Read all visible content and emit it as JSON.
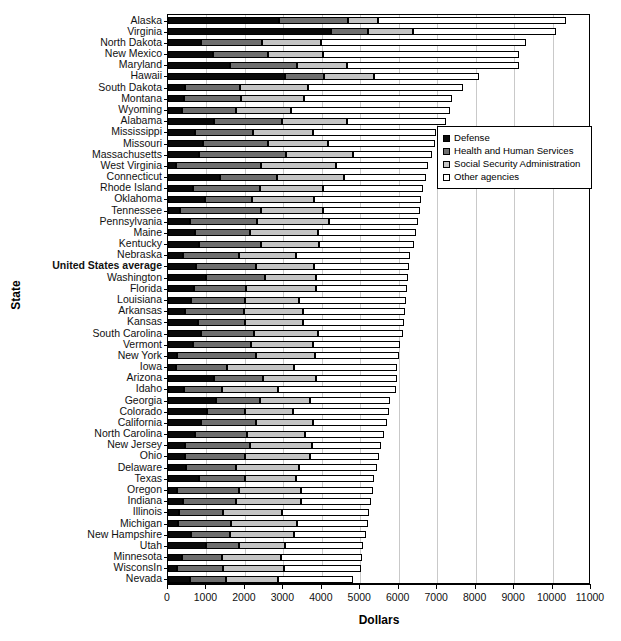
{
  "chart_data": {
    "type": "bar",
    "orientation": "horizontal",
    "stacked": true,
    "title": "",
    "xlabel": "Dollars",
    "ylabel": "State",
    "xlim": [
      0,
      11000
    ],
    "xticks": [
      0,
      1000,
      2000,
      3000,
      4000,
      5000,
      6000,
      7000,
      8000,
      9000,
      10000,
      11000
    ],
    "grid": "vertical",
    "legend_position": "upper-right-inside",
    "series": [
      {
        "name": "Defense",
        "color": "#0a0a0a"
      },
      {
        "name": "Health and Human Services",
        "color": "#6e6e6e"
      },
      {
        "name": "Social Security Administration",
        "color": "#c4c4c4"
      },
      {
        "name": "Other agencies",
        "color": "#ffffff"
      }
    ],
    "categories": [
      "Alaska",
      "Virginia",
      "North Dakota",
      "New Mexico",
      "Maryland",
      "Hawaii",
      "South Dakota",
      "Montana",
      "Wyoming",
      "Alabama",
      "Mississippi",
      "Missouri",
      "Massachusetts",
      "West Virginia",
      "Connecticut",
      "Rhode Island",
      "Oklahoma",
      "Tennessee",
      "Pennsylvania",
      "Maine",
      "Kentucky",
      "Nebraska",
      "United States average",
      "Washington",
      "Florida",
      "Louisiana",
      "Arkansas",
      "Kansas",
      "South Carolina",
      "Vermont",
      "New York",
      "Iowa",
      "Arizona",
      "Idaho",
      "Georgia",
      "Colorado",
      "California",
      "North Carolina",
      "New Jersey",
      "Ohio",
      "Delaware",
      "Texas",
      "Oregon",
      "Indiana",
      "Illinois",
      "Michigan",
      "New Hampshire",
      "Utah",
      "Minnesota",
      "WisconsIn",
      "Nevada"
    ],
    "highlight_category": "United States average",
    "rows": [
      {
        "state": "Alaska",
        "defense": 2890,
        "hhs": 1790,
        "ssa": 770,
        "other": 4890,
        "total": 10340
      },
      {
        "state": "Virginia",
        "defense": 4250,
        "hhs": 960,
        "ssa": 1150,
        "other": 3740,
        "total": 10100
      },
      {
        "state": "North Dakota",
        "defense": 850,
        "hhs": 1600,
        "ssa": 1530,
        "other": 5340,
        "total": 9320
      },
      {
        "state": "New Mexico",
        "defense": 1180,
        "hhs": 1430,
        "ssa": 1420,
        "other": 5110,
        "total": 9140
      },
      {
        "state": "Maryland",
        "defense": 1610,
        "hhs": 1740,
        "ssa": 1300,
        "other": 4470,
        "total": 9120
      },
      {
        "state": "Hawaii",
        "defense": 3040,
        "hhs": 1020,
        "ssa": 1300,
        "other": 2720,
        "total": 8080
      },
      {
        "state": "South Dakota",
        "defense": 440,
        "hhs": 1430,
        "ssa": 1780,
        "other": 4020,
        "total": 7670
      },
      {
        "state": "Montana",
        "defense": 420,
        "hhs": 1490,
        "ssa": 1630,
        "other": 3840,
        "total": 7380
      },
      {
        "state": "Wyoming",
        "defense": 370,
        "hhs": 1400,
        "ssa": 1440,
        "other": 4130,
        "total": 7340
      },
      {
        "state": "Alabama",
        "defense": 1200,
        "hhs": 1760,
        "ssa": 1700,
        "other": 2560,
        "total": 7220
      },
      {
        "state": "Mississippi",
        "defense": 690,
        "hhs": 1510,
        "ssa": 1580,
        "other": 3180,
        "total": 6960
      },
      {
        "state": "Missouri",
        "defense": 910,
        "hhs": 1680,
        "ssa": 1570,
        "other": 2780,
        "total": 6940
      },
      {
        "state": "Massachusetts",
        "defense": 810,
        "hhs": 2260,
        "ssa": 1730,
        "other": 2070,
        "total": 6870
      },
      {
        "state": "West Virginia",
        "defense": 210,
        "hhs": 2200,
        "ssa": 1970,
        "other": 2380,
        "total": 6760
      },
      {
        "state": "Connecticut",
        "defense": 1360,
        "hhs": 1470,
        "ssa": 1760,
        "other": 2110,
        "total": 6700
      },
      {
        "state": "Rhode Island",
        "defense": 640,
        "hhs": 1760,
        "ssa": 1630,
        "other": 2590,
        "total": 6620
      },
      {
        "state": "Oklahoma",
        "defense": 960,
        "hhs": 1220,
        "ssa": 1620,
        "other": 2790,
        "total": 6590
      },
      {
        "state": "Tennessee",
        "defense": 320,
        "hhs": 2090,
        "ssa": 1630,
        "other": 2520,
        "total": 6560
      },
      {
        "state": "Pennsylvania",
        "defense": 570,
        "hhs": 1750,
        "ssa": 1870,
        "other": 2320,
        "total": 6510
      },
      {
        "state": "Maine",
        "defense": 700,
        "hhs": 1420,
        "ssa": 1790,
        "other": 2540,
        "total": 6450
      },
      {
        "state": "Kentucky",
        "defense": 810,
        "hhs": 1620,
        "ssa": 1500,
        "other": 2470,
        "total": 6400
      },
      {
        "state": "Nebraska",
        "defense": 400,
        "hhs": 1440,
        "ssa": 1490,
        "other": 2970,
        "total": 6300
      },
      {
        "state": "United States average",
        "defense": 740,
        "hhs": 1560,
        "ssa": 1500,
        "other": 2460,
        "total": 6260
      },
      {
        "state": "Washington",
        "defense": 980,
        "hhs": 1540,
        "ssa": 1340,
        "other": 2370,
        "total": 6230
      },
      {
        "state": "Florida",
        "defense": 670,
        "hhs": 1350,
        "ssa": 1820,
        "other": 2380,
        "total": 6220
      },
      {
        "state": "Louisiana",
        "defense": 590,
        "hhs": 1410,
        "ssa": 1410,
        "other": 2790,
        "total": 6200
      },
      {
        "state": "Arkansas",
        "defense": 440,
        "hhs": 1540,
        "ssa": 1540,
        "other": 2650,
        "total": 6170
      },
      {
        "state": "Kansas",
        "defense": 780,
        "hhs": 1230,
        "ssa": 1510,
        "other": 2620,
        "total": 6140
      },
      {
        "state": "South Carolina",
        "defense": 870,
        "hhs": 1360,
        "ssa": 1680,
        "other": 2190,
        "total": 6100
      },
      {
        "state": "Vermont",
        "defense": 660,
        "hhs": 1500,
        "ssa": 1610,
        "other": 2270,
        "total": 6040
      },
      {
        "state": "New York",
        "defense": 230,
        "hhs": 2060,
        "ssa": 1530,
        "other": 2190,
        "total": 6010
      },
      {
        "state": "Iowa",
        "defense": 210,
        "hhs": 1320,
        "ssa": 1760,
        "other": 2670,
        "total": 5960
      },
      {
        "state": "Arizona",
        "defense": 1200,
        "hhs": 1270,
        "ssa": 1370,
        "other": 2110,
        "total": 5950
      },
      {
        "state": "Idaho",
        "defense": 410,
        "hhs": 990,
        "ssa": 1450,
        "other": 3070,
        "total": 5920
      },
      {
        "state": "Georgia",
        "defense": 1250,
        "hhs": 1130,
        "ssa": 1320,
        "other": 2070,
        "total": 5770
      },
      {
        "state": "Colorado",
        "defense": 1010,
        "hhs": 1000,
        "ssa": 1240,
        "other": 2490,
        "total": 5740
      },
      {
        "state": "California",
        "defense": 860,
        "hhs": 1430,
        "ssa": 1470,
        "other": 1930,
        "total": 5690
      },
      {
        "state": "North Carolina",
        "defense": 710,
        "hhs": 1340,
        "ssa": 1510,
        "other": 2060,
        "total": 5620
      },
      {
        "state": "New Jersey",
        "defense": 450,
        "hhs": 1680,
        "ssa": 1620,
        "other": 1800,
        "total": 5550
      },
      {
        "state": "Ohio",
        "defense": 430,
        "hhs": 1560,
        "ssa": 1700,
        "other": 1810,
        "total": 5500
      },
      {
        "state": "Delaware",
        "defense": 470,
        "hhs": 1290,
        "ssa": 1640,
        "other": 2040,
        "total": 5440
      },
      {
        "state": "Texas",
        "defense": 810,
        "hhs": 1180,
        "ssa": 1340,
        "other": 2030,
        "total": 5360
      },
      {
        "state": "Oregon",
        "defense": 230,
        "hhs": 1620,
        "ssa": 1610,
        "other": 1860,
        "total": 5320
      },
      {
        "state": "Indiana",
        "defense": 390,
        "hhs": 1380,
        "ssa": 1680,
        "other": 1840,
        "total": 5290
      },
      {
        "state": "Illinois",
        "defense": 290,
        "hhs": 1130,
        "ssa": 1540,
        "other": 2280,
        "total": 5240
      },
      {
        "state": "Michigan",
        "defense": 260,
        "hhs": 1390,
        "ssa": 1700,
        "other": 1850,
        "total": 5200
      },
      {
        "state": "New Hampshire",
        "defense": 610,
        "hhs": 1000,
        "ssa": 1670,
        "other": 1860,
        "total": 5140
      },
      {
        "state": "Utah",
        "defense": 980,
        "hhs": 870,
        "ssa": 1180,
        "other": 2050,
        "total": 5080
      },
      {
        "state": "Minnesota",
        "defense": 360,
        "hhs": 1050,
        "ssa": 1540,
        "other": 2100,
        "total": 5050
      },
      {
        "state": "WisconsIn",
        "defense": 230,
        "hhs": 1210,
        "ssa": 1570,
        "other": 2010,
        "total": 5020
      },
      {
        "state": "Nevada",
        "defense": 570,
        "hhs": 950,
        "ssa": 1340,
        "other": 1960,
        "total": 4820
      }
    ]
  },
  "legend": {
    "items": [
      {
        "label": "Defense"
      },
      {
        "label": "Health and Human Services"
      },
      {
        "label": "Social Security Administration"
      },
      {
        "label": "Other agencies"
      }
    ]
  },
  "axes": {
    "x_title": "Dollars",
    "y_title": "State"
  }
}
